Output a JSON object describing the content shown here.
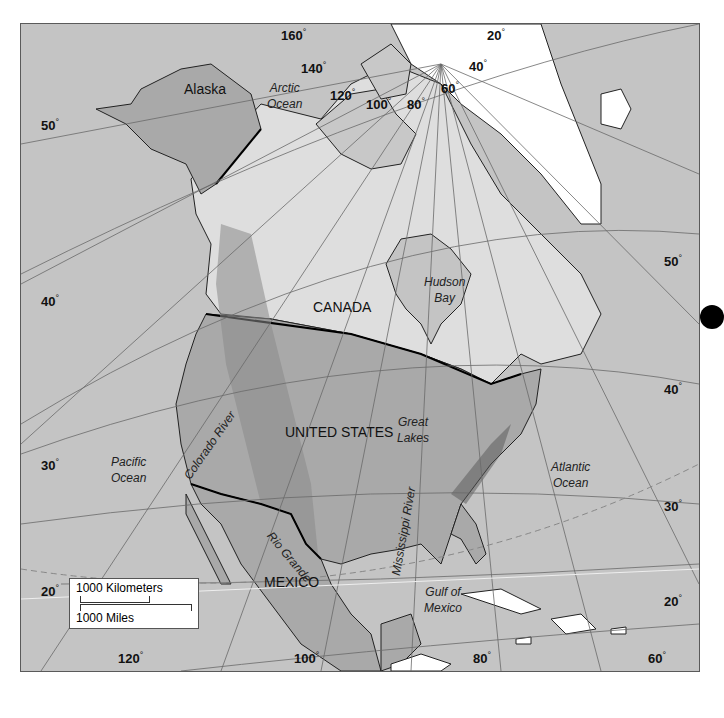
{
  "map": {
    "title": "North America",
    "colors": {
      "ocean": "#c4c4c4",
      "canada": "#dedede",
      "usa": "#a9a9a9",
      "mexico": "#a9a9a9",
      "alaska": "#a9a9a9",
      "greenland": "#ffffff",
      "caribbean": "#ffffff",
      "graticule": "#6a6a6a",
      "border": "#111111"
    },
    "countries": {
      "alaska": "Alaska",
      "canada": "CANADA",
      "usa": "UNITED STATES",
      "mexico": "MEXICO"
    },
    "water_bodies": {
      "arctic": [
        "Arctic",
        "Ocean"
      ],
      "hudson": [
        "Hudson",
        "Bay"
      ],
      "pacific": [
        "Pacific",
        "Ocean"
      ],
      "atlantic": [
        "Atlantic",
        "Ocean"
      ],
      "gulf": [
        "Gulf of",
        "Mexico"
      ],
      "great_lakes": [
        "Great",
        "Lakes"
      ]
    },
    "rivers": {
      "colorado": "Colorado River",
      "rio_grande": "Rio Grande",
      "mississippi": "Mississippi River"
    },
    "longitude_labels": [
      "160",
      "140",
      "120",
      "100",
      "80",
      "60",
      "40",
      "20",
      "120",
      "100",
      "80",
      "60"
    ],
    "latitude_labels_left": [
      "50",
      "40",
      "30",
      "20"
    ],
    "latitude_labels_right": [
      "50",
      "40",
      "30",
      "20"
    ],
    "degree_symbol": "°",
    "scale_bar": {
      "km_label": "1000 Kilometers",
      "mi_label": "1000 Miles"
    }
  }
}
